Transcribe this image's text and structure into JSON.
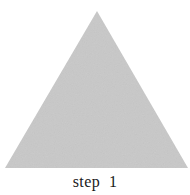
{
  "figure": {
    "background_color": "#ffffff",
    "width": 190,
    "height": 195,
    "caption": "step  1",
    "caption_color": "#1a1a1a"
  },
  "shape": {
    "name": "triangle",
    "type": "polygon",
    "sides": 3,
    "fill_color": "#c8c8c8",
    "stroke_color": "none",
    "texture": "fine-grain-noise",
    "vertices": [
      {
        "label": "apex",
        "x": 97,
        "y": 11
      },
      {
        "label": "bottom-right",
        "x": 188,
        "y": 168
      },
      {
        "label": "bottom-left",
        "x": 5,
        "y": 168
      }
    ],
    "points_attr": "97,11 188,168 5,168"
  }
}
